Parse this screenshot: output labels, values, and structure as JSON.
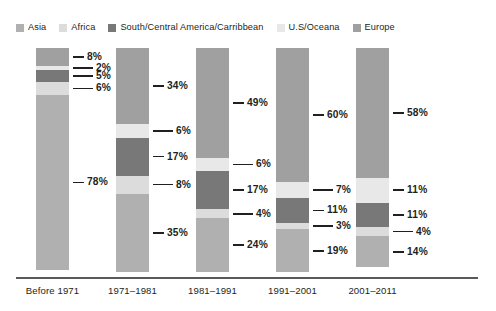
{
  "legend": {
    "items": [
      {
        "label": "Asia",
        "color": "#b0b0b0"
      },
      {
        "label": "Africa",
        "color": "#dcdcdc"
      },
      {
        "label": "South/Central America/Carribbean",
        "color": "#787878"
      },
      {
        "label": "U.S/Oceana",
        "color": "#e8e8e8"
      },
      {
        "label": "Europe",
        "color": "#a0a0a0"
      }
    ]
  },
  "chart_data": {
    "type": "bar",
    "title": "",
    "xlabel": "",
    "ylabel": "",
    "ylim": [
      0,
      100
    ],
    "stacked": true,
    "percent": true,
    "grid": false,
    "legend_position": "top",
    "categories": [
      "Before 1971",
      "1971–1981",
      "1981–1991",
      "1991–2001",
      "2001–2011"
    ],
    "series": [
      {
        "name": "Europe",
        "color": "#a0a0a0",
        "values": [
          8,
          34,
          49,
          60,
          58
        ]
      },
      {
        "name": "U.S/Oceana",
        "color": "#e8e8e8",
        "values": [
          2,
          6,
          6,
          7,
          11
        ]
      },
      {
        "name": "South/Central America/Carribbean",
        "color": "#787878",
        "values": [
          5,
          17,
          17,
          11,
          11
        ]
      },
      {
        "name": "Africa",
        "color": "#dcdcdc",
        "values": [
          6,
          8,
          4,
          3,
          4
        ]
      },
      {
        "name": "Asia",
        "color": "#b0b0b0",
        "values": [
          78,
          35,
          24,
          19,
          14
        ]
      }
    ],
    "data_labels": [
      [
        "8%",
        "2%",
        "5%",
        "6%",
        "78%"
      ],
      [
        "34%",
        "6%",
        "17%",
        "8%",
        "35%"
      ],
      [
        "49%",
        "6%",
        "17%",
        "4%",
        "24%"
      ],
      [
        "60%",
        "7%",
        "11%",
        "3%",
        "19%"
      ],
      [
        "58%",
        "11%",
        "11%",
        "4%",
        "14%"
      ]
    ]
  },
  "axis": {
    "labels": [
      "Before 1971",
      "1971–1981",
      "1981–1991",
      "1991–2001",
      "2001–2011"
    ]
  }
}
